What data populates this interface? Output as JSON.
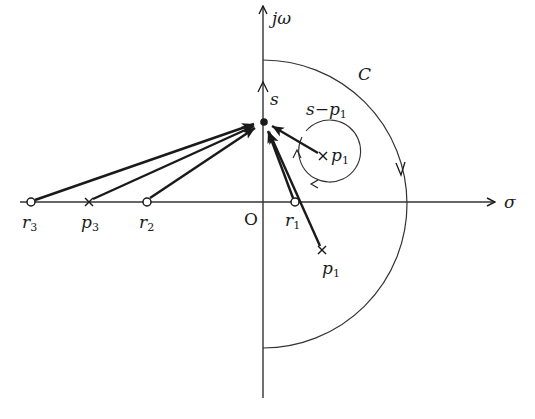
{
  "diagram": {
    "type": "s-plane contour / Nyquist argument-principle figure",
    "colors": {
      "stroke": "#1a1a1a",
      "thin": "#333333",
      "background": "#ffffff"
    },
    "axes": {
      "imag_label": "jω",
      "real_label": "σ",
      "origin_label": "O"
    },
    "contour_label": "C",
    "point_s": {
      "label": "s",
      "x": 264,
      "y": 122
    },
    "vector_label": {
      "main": "s−p",
      "sub": "1"
    },
    "points": [
      {
        "id": "r3",
        "kind": "zero",
        "main": "r",
        "sub": "3"
      },
      {
        "id": "p3",
        "kind": "pole",
        "main": "p",
        "sub": "3"
      },
      {
        "id": "r2",
        "kind": "zero",
        "main": "r",
        "sub": "2"
      },
      {
        "id": "r1",
        "kind": "zero",
        "main": "r",
        "sub": "1"
      },
      {
        "id": "p1_upper",
        "kind": "pole",
        "main": "p",
        "sub": "1"
      },
      {
        "id": "p1_lower",
        "kind": "pole",
        "main": "p",
        "sub": "1"
      }
    ]
  }
}
